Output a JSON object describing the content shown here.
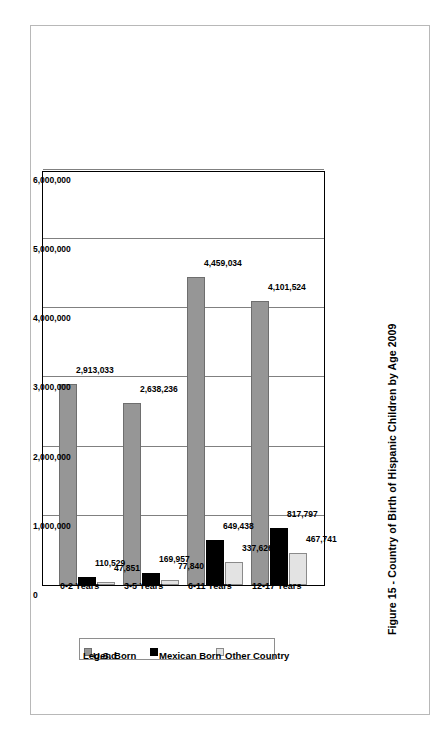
{
  "figure": {
    "caption": "Figure 15 - Country of Birth of Hispanic Children by Age 2009"
  },
  "legend": {
    "title": "Legend",
    "entries": [
      {
        "label": "U.S. Born",
        "color": "#969696",
        "swatch": "us"
      },
      {
        "label": "Mexican Born",
        "color": "#000000",
        "swatch": "mexican"
      },
      {
        "label": "Other Country",
        "color": "#e3e3e3",
        "swatch": "other"
      }
    ]
  },
  "axis": {
    "ticks": [
      "0",
      "1,000,000",
      "2,000,000",
      "3,000,000",
      "4,000,000",
      "5,000,000",
      "6,000,000"
    ]
  },
  "categories": [
    {
      "name": "0-2 Years",
      "values": [
        {
          "series": "U.S. Born",
          "label": "2,913,033",
          "value": 2913033
        },
        {
          "series": "Mexican Born",
          "label": "110,529",
          "value": 110529
        },
        {
          "series": "Other Country",
          "label": "47,851",
          "value": 47851
        }
      ]
    },
    {
      "name": "3-5 Years",
      "values": [
        {
          "series": "U.S. Born",
          "label": "2,638,236",
          "value": 2638236
        },
        {
          "series": "Mexican Born",
          "label": "169,957",
          "value": 169957
        },
        {
          "series": "Other Country",
          "label": "77,840",
          "value": 77840
        }
      ]
    },
    {
      "name": "6-11 Years",
      "values": [
        {
          "series": "U.S. Born",
          "label": "4,459,034",
          "value": 4459034
        },
        {
          "series": "Mexican Born",
          "label": "649,438",
          "value": 649438
        },
        {
          "series": "Other Country",
          "label": "337,626",
          "value": 337626
        }
      ]
    },
    {
      "name": "12-17 Years",
      "values": [
        {
          "series": "U.S. Born",
          "label": "4,101,524",
          "value": 4101524
        },
        {
          "series": "Mexican Born",
          "label": "817,797",
          "value": 817797
        },
        {
          "series": "Other Country",
          "label": "467,741",
          "value": 467741
        }
      ]
    }
  ],
  "chart_data": {
    "type": "bar",
    "orientation": "vertical",
    "rotated_page": true,
    "title": "Figure 15 - Country of Birth of Hispanic Children by Age 2009",
    "xlabel": "",
    "ylabel": "",
    "categories": [
      "0-2 Years",
      "3-5 Years",
      "6-11 Years",
      "12-17 Years"
    ],
    "series": [
      {
        "name": "U.S. Born",
        "color": "#969696",
        "values": [
          2913033,
          2638236,
          4459034,
          4101524
        ]
      },
      {
        "name": "Mexican Born",
        "color": "#000000",
        "values": [
          110529,
          169957,
          649438,
          817797
        ]
      },
      {
        "name": "Other Country",
        "color": "#e3e3e3",
        "values": [
          47851,
          77840,
          337626,
          467741
        ]
      }
    ],
    "ylim": [
      0,
      6000000
    ],
    "ytick_labels": [
      "0",
      "1,000,000",
      "2,000,000",
      "3,000,000",
      "4,000,000",
      "5,000,000",
      "6,000,000"
    ],
    "yticks": [
      0,
      1000000,
      2000000,
      3000000,
      4000000,
      5000000,
      6000000
    ],
    "grid": true,
    "data_labels": true,
    "legend_position": "left"
  }
}
